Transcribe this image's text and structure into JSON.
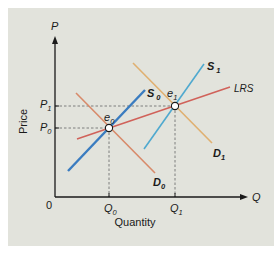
{
  "axes": {
    "y_symbol": "P",
    "x_symbol": "Q",
    "y_label": "Price",
    "x_label": "Quantity",
    "origin": "0"
  },
  "ticks": {
    "p1": {
      "main": "P",
      "sub": "1"
    },
    "p0": {
      "main": "P",
      "sub": "0"
    },
    "q0": {
      "main": "Q",
      "sub": "0"
    },
    "q1": {
      "main": "Q",
      "sub": "1"
    }
  },
  "curves": {
    "s0": {
      "main": "S",
      "sub": "0",
      "color": "#3a7cc0"
    },
    "s1": {
      "main": "S",
      "sub": "1",
      "color": "#4fa9cf"
    },
    "d0": {
      "main": "D",
      "sub": "0",
      "color": "#d88a6a"
    },
    "d1": {
      "main": "D",
      "sub": "1",
      "color": "#e0b070"
    },
    "lrs": {
      "label": "LRS",
      "color": "#d0625a"
    }
  },
  "points": {
    "e0": {
      "main": "e",
      "sub": "0"
    },
    "e1": {
      "main": "e",
      "sub": "1"
    }
  },
  "colors": {
    "background": "#e2e3dc",
    "axis": "#1a1a1a"
  }
}
